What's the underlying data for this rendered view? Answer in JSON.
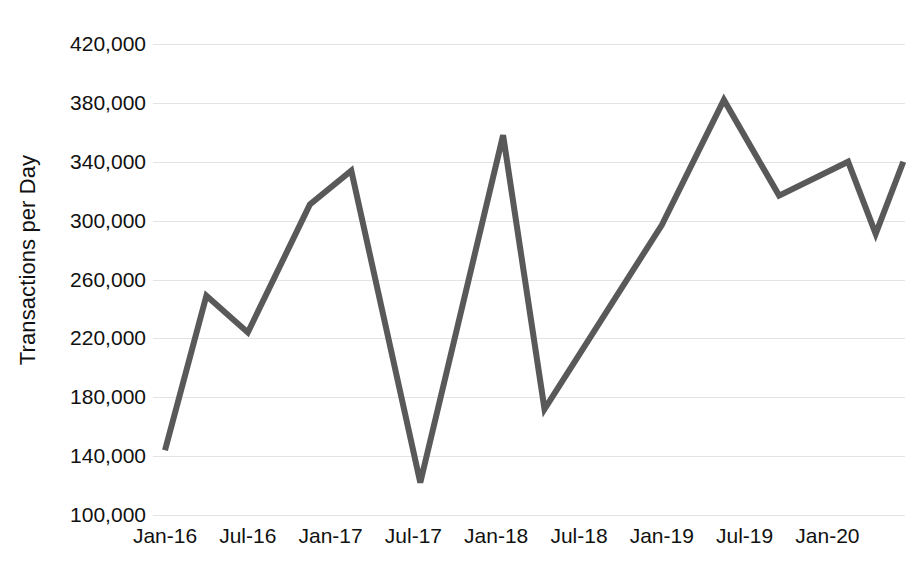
{
  "chart_data": {
    "type": "line",
    "title": "",
    "xlabel": "",
    "ylabel": "Transactions per Day",
    "ylim": [
      100000,
      420000
    ],
    "ytick_step": 40000,
    "ytick_labels": [
      "420,000",
      "380,000",
      "340,000",
      "300,000",
      "260,000",
      "220,000",
      "180,000",
      "140,000",
      "100,000"
    ],
    "ytick_values": [
      420000,
      380000,
      340000,
      300000,
      260000,
      220000,
      180000,
      140000,
      100000
    ],
    "xtick_labels": [
      "Jan-16",
      "Jul-16",
      "Jan-17",
      "Jul-17",
      "Jan-18",
      "Jul-18",
      "Jan-19",
      "Jul-19",
      "Jan-20"
    ],
    "grid": "horizontal",
    "legend": "none",
    "line_color": "#595959",
    "line_width": 6,
    "series": [
      {
        "name": "Transactions per Day",
        "x": [
          "Jan-16",
          "Apr-16",
          "Jul-16",
          "Nov-16",
          "Jan-17",
          "Apr-17",
          "Jul-17",
          "Jan-18",
          "Apr-18",
          "Jan-19",
          "May-19",
          "Jul-19",
          "Nov-19",
          "Jan-20",
          "Mar-20"
        ],
        "values": [
          144000,
          249000,
          224000,
          311000,
          334000,
          122000,
          122000,
          358000,
          172000,
          297000,
          382000,
          317000,
          340000,
          291000,
          340000
        ]
      }
    ],
    "points": [
      {
        "x": "Jan-16",
        "xm": 0,
        "y": 144000
      },
      {
        "x": "Apr-16",
        "xm": 3,
        "y": 249000
      },
      {
        "x": "Jul-16",
        "xm": 6,
        "y": 224000
      },
      {
        "x": "Nov-16",
        "xm": 10.5,
        "y": 311000
      },
      {
        "x": "Jan-17",
        "xm": 13.5,
        "y": 334000
      },
      {
        "x": "Jul-17",
        "xm": 18.5,
        "y": 122000
      },
      {
        "x": "Dec-17",
        "xm": 24.5,
        "y": 358000
      },
      {
        "x": "Apr-18",
        "xm": 27.5,
        "y": 172000
      },
      {
        "x": "Jan-19",
        "xm": 36,
        "y": 297000
      },
      {
        "x": "May-19",
        "xm": 40.5,
        "y": 382000
      },
      {
        "x": "Jul-19",
        "xm": 44.5,
        "y": 317000
      },
      {
        "x": "Nov-19",
        "xm": 49.5,
        "y": 340000
      },
      {
        "x": "Jan-20",
        "xm": 51.5,
        "y": 291000
      },
      {
        "x": "Mar-20",
        "xm": 53.5,
        "y": 340000
      }
    ]
  },
  "axis": {
    "y_title": "Transactions per Day"
  }
}
